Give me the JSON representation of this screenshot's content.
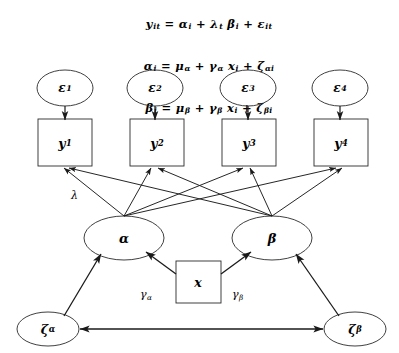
{
  "figure": {
    "background_color": "#ffffff",
    "stroke_color": "#1a1a1a"
  },
  "equations": [
    "yᵢₜ = αᵢ + λₜ βᵢ + εᵢₜ",
    "αᵢ = μα + γα xᵢ + ζαᵢ",
    "βᵢ = μβ + γβ xᵢ + ζβᵢ"
  ],
  "equation_parts": [
    {
      "lhs": "y",
      "lhs_sub": "it",
      "terms": [
        {
          "sym": "α",
          "sub": "i"
        },
        {
          "sym": "λ",
          "sub": "t"
        },
        {
          "sym": "β",
          "sub": "i"
        },
        {
          "sym": "ε",
          "sub": "it"
        }
      ]
    },
    {
      "lhs": "α",
      "lhs_sub": "i",
      "terms": [
        {
          "sym": "μ",
          "sub": "α"
        },
        {
          "sym": "γ",
          "sub": "α"
        },
        {
          "sym": "x",
          "sub": "i"
        },
        {
          "sym": "ζ",
          "sub": "αi"
        }
      ]
    },
    {
      "lhs": "β",
      "lhs_sub": "i",
      "terms": [
        {
          "sym": "μ",
          "sub": "β"
        },
        {
          "sym": "γ",
          "sub": "β"
        },
        {
          "sym": "x",
          "sub": "i"
        },
        {
          "sym": "ζ",
          "sub": "βi"
        }
      ]
    }
  ],
  "errors": [
    {
      "symbol": "ε",
      "subscript": "1"
    },
    {
      "symbol": "ε",
      "subscript": "2"
    },
    {
      "symbol": "ε",
      "subscript": "3"
    },
    {
      "symbol": "ε",
      "subscript": "4"
    }
  ],
  "indicators": [
    {
      "symbol": "y",
      "subscript": "1"
    },
    {
      "symbol": "y",
      "subscript": "2"
    },
    {
      "symbol": "y",
      "subscript": "3"
    },
    {
      "symbol": "y",
      "subscript": "4"
    }
  ],
  "latents": [
    {
      "symbol": "α",
      "subscript": ""
    },
    {
      "symbol": "β",
      "subscript": ""
    }
  ],
  "predictor": {
    "symbol": "x",
    "subscript": ""
  },
  "disturbances": [
    {
      "symbol": "ζ",
      "subscript": "α"
    },
    {
      "symbol": "ζ",
      "subscript": "β"
    }
  ],
  "path_labels": {
    "loading": {
      "symbol": "λ",
      "subscript": ""
    },
    "gamma_alpha": {
      "symbol": "γ",
      "subscript": "α"
    },
    "gamma_beta": {
      "symbol": "γ",
      "subscript": "β"
    }
  }
}
